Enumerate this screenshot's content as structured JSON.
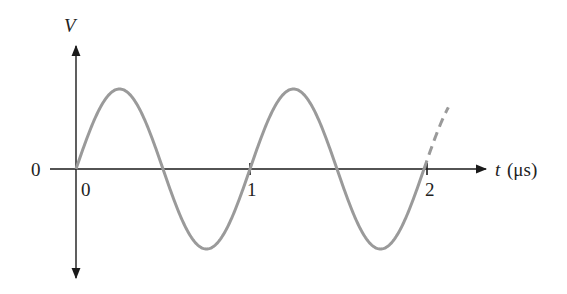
{
  "chart_data": {
    "type": "line",
    "title": "",
    "xlabel": "t (μs)",
    "ylabel": "V",
    "x_ticks": [
      "0",
      "1",
      "2"
    ],
    "y_ticks": [
      "0"
    ],
    "series": [
      {
        "name": "V(t) = sin(2πt)",
        "function": "sine",
        "period_us": 1,
        "x": [
          0,
          0.25,
          0.5,
          0.75,
          1.0,
          1.25,
          1.5,
          1.75,
          2.0
        ],
        "values": [
          0,
          1,
          0,
          -1,
          0,
          1,
          0,
          -1,
          0
        ],
        "continuation": "dashed beyond t=2"
      }
    ],
    "grid": false,
    "legend": "none"
  },
  "labels": {
    "y_axis": "V",
    "x_axis_var": "t",
    "x_axis_unit": "(μs)",
    "origin_y": "0",
    "tick_0": "0",
    "tick_1": "1",
    "tick_2": "2"
  },
  "colors": {
    "axis": "#1a1a1a",
    "curve": "#9a9a9a"
  }
}
